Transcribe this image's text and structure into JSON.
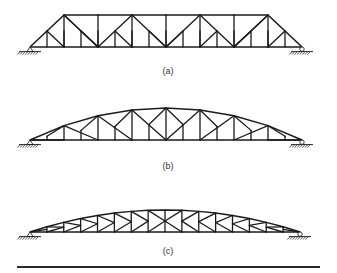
{
  "figure": {
    "line_color": "#1a1a1a",
    "background": "#ffffff"
  },
  "trusses": [
    {
      "id": "a",
      "caption": "(a)",
      "type": "parallel-chord subdivided Warren (Baltimore/Petit-type) with sloped end posts",
      "subpanels": 16,
      "supports": [
        "pin-left",
        "roller-right"
      ]
    },
    {
      "id": "b",
      "caption": "(b)",
      "type": "curved top chord (Parker/camelback) with subdivided panels",
      "subpanels": 16,
      "supports": [
        "pin-left",
        "roller-right"
      ]
    },
    {
      "id": "c",
      "caption": "(c)",
      "type": "curved top chord K-truss",
      "subpanels": 16,
      "supports": [
        "pin-left",
        "roller-right"
      ]
    }
  ]
}
